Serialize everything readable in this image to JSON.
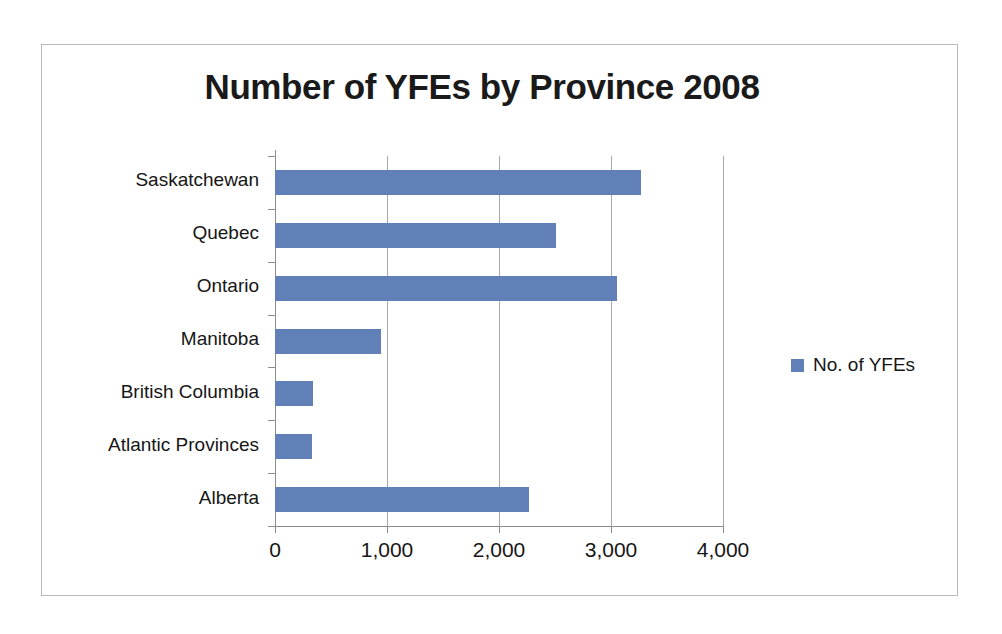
{
  "frame": {
    "border_color": "#b9b9b9",
    "background": "#ffffff"
  },
  "chart_data": {
    "type": "bar",
    "orientation": "horizontal",
    "title": "Number of YFEs by Province 2008",
    "xlabel": "",
    "ylabel": "",
    "categories": [
      "Saskatchewan",
      "Quebec",
      "Ontario",
      "Manitoba",
      "British Columbia",
      "Atlantic Provinces",
      "Alberta"
    ],
    "series": [
      {
        "name": "No. of YFEs",
        "color": "#6180b8",
        "values": [
          3270,
          2510,
          3050,
          950,
          340,
          330,
          2270
        ]
      }
    ],
    "xlim": [
      0,
      4000
    ],
    "xticks": [
      0,
      1000,
      2000,
      3000,
      4000
    ],
    "xtick_labels": [
      "0",
      "1,000",
      "2,000",
      "3,000",
      "4,000"
    ],
    "grid": "vertical",
    "legend_position": "right",
    "legend_entries": [
      "No. of YFEs"
    ]
  }
}
